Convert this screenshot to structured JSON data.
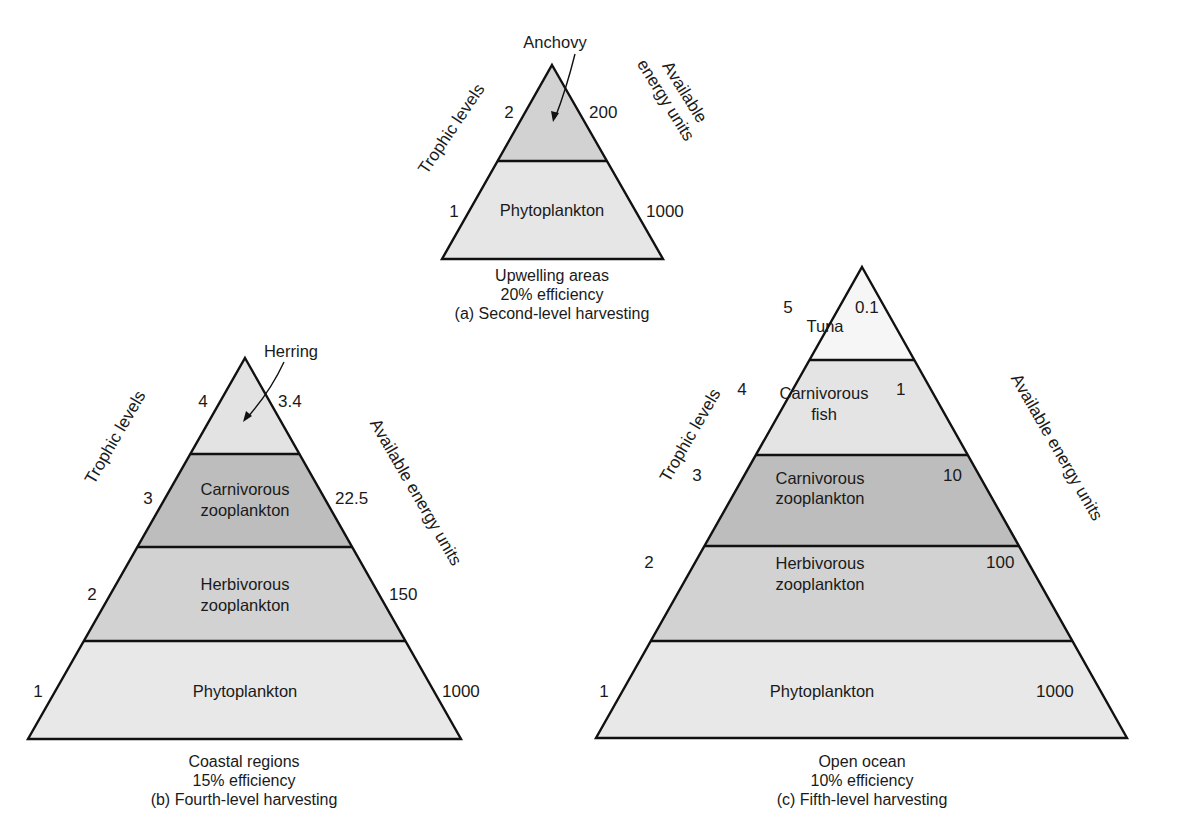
{
  "colors": {
    "lightest": "#f5f5f5",
    "light": "#e6e6e6",
    "medium": "#d2d2d2",
    "dark": "#bdbdbd",
    "outline": "#111111"
  },
  "axis_titles": {
    "left": "Trophic levels",
    "right_single": "Available energy units",
    "right_line1": "Available",
    "right_line2": "energy units"
  },
  "pyramids": [
    {
      "id": "a",
      "caption": [
        "Upwelling areas",
        "20% efficiency",
        "(a) Second-level harvesting"
      ],
      "callout": "Anchovy",
      "levels": [
        {
          "trophic_level": "2",
          "label": [
            ""
          ],
          "energy": "200"
        },
        {
          "trophic_level": "1",
          "label": [
            "Phytoplankton"
          ],
          "energy": "1000"
        }
      ]
    },
    {
      "id": "b",
      "caption": [
        "Coastal regions",
        "15% efficiency",
        "(b) Fourth-level harvesting"
      ],
      "callout": "Herring",
      "levels": [
        {
          "trophic_level": "4",
          "label": [
            ""
          ],
          "energy": "3.4"
        },
        {
          "trophic_level": "3",
          "label": [
            "Carnivorous",
            "zooplankton"
          ],
          "energy": "22.5"
        },
        {
          "trophic_level": "2",
          "label": [
            "Herbivorous",
            "zooplankton"
          ],
          "energy": "150"
        },
        {
          "trophic_level": "1",
          "label": [
            "Phytoplankton"
          ],
          "energy": "1000"
        }
      ]
    },
    {
      "id": "c",
      "caption": [
        "Open ocean",
        "10% efficiency",
        "(c) Fifth-level harvesting"
      ],
      "callout": "",
      "levels": [
        {
          "trophic_level": "5",
          "label": [
            "Tuna"
          ],
          "energy": "0.1"
        },
        {
          "trophic_level": "4",
          "label": [
            "Carnivorous",
            "fish"
          ],
          "energy": "1"
        },
        {
          "trophic_level": "3",
          "label": [
            "Carnivorous",
            "zooplankton"
          ],
          "energy": "10"
        },
        {
          "trophic_level": "2",
          "label": [
            "Herbivorous",
            "zooplankton"
          ],
          "energy": "100"
        },
        {
          "trophic_level": "1",
          "label": [
            "Phytoplankton"
          ],
          "energy": "1000"
        }
      ]
    }
  ]
}
